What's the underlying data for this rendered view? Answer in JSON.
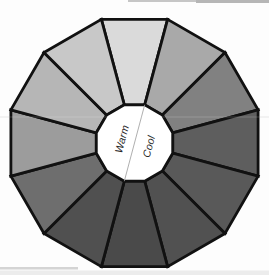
{
  "page": {
    "background": "#fdfdfd"
  },
  "wheel": {
    "outline_color": "#111111",
    "inner_fill": "#ffffff",
    "divider_color": "#9b9b9b",
    "center_labels": [
      {
        "text": "Warm",
        "side": "warm"
      },
      {
        "text": "Cool",
        "side": "cool"
      }
    ],
    "segments": [
      {
        "position": "12 o'clock",
        "side": "warm",
        "color": "#dadada"
      },
      {
        "position": "1 o'clock",
        "side": "cool",
        "color": "#a9a9a9"
      },
      {
        "position": "2 o'clock",
        "side": "cool",
        "color": "#818181"
      },
      {
        "position": "3 o'clock",
        "side": "cool",
        "color": "#5e5e5e"
      },
      {
        "position": "4 o'clock",
        "side": "cool",
        "color": "#595959"
      },
      {
        "position": "5 o'clock",
        "side": "cool",
        "color": "#515151"
      },
      {
        "position": "6 o'clock",
        "side": "cool",
        "color": "#4a4a4a"
      },
      {
        "position": "7 o'clock",
        "side": "warm",
        "color": "#505050"
      },
      {
        "position": "8 o'clock",
        "side": "warm",
        "color": "#6e6e6e"
      },
      {
        "position": "9 o'clock",
        "side": "warm",
        "color": "#9c9c9c"
      },
      {
        "position": "10 o'clock",
        "side": "warm",
        "color": "#b6b6b6"
      },
      {
        "position": "11 o'clock",
        "side": "warm",
        "color": "#c8c8c8"
      }
    ]
  }
}
